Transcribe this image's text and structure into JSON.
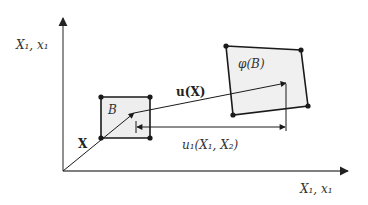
{
  "diagram": {
    "type": "deformation-mapping",
    "axes": {
      "vertical_label": "X₁, x₁",
      "horizontal_label": "X₁, x₁"
    },
    "reference_body": {
      "label": "B"
    },
    "current_body": {
      "label": "φ(B)"
    },
    "position_vector": {
      "label": "X"
    },
    "displacement_vector": {
      "label": "u(X)"
    },
    "displacement_component": {
      "label": "u₁(X₁, X₂)"
    }
  },
  "colors": {
    "line": "#1a1a1a",
    "axis": "#555555",
    "fill_reference": "#eeeeee",
    "fill_current": "#f0f0f0",
    "text": "#333333"
  }
}
